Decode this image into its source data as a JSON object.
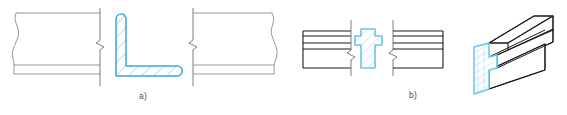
{
  "figure": {
    "captions": {
      "a": "a)",
      "b": "b)"
    },
    "colors": {
      "section_outline": "#3aa7dd",
      "section_hatch": "#6cc3e8",
      "section_fill": "#ffffff",
      "thin_outline": "#8a8a8a",
      "bold_outline": "#1a1a1a",
      "break_line": "#6e6e6e",
      "caption_text": "#4a4a4a",
      "page_background": "#ffffff"
    },
    "parts": [
      {
        "id": "a",
        "label": "a)",
        "description": "Long bar in elevation with a revolved angle (L) section placed in a break gap",
        "elements": [
          {
            "name": "left-bar-elevation",
            "kind": "orthographic-view",
            "edges": 3,
            "break_type": "wavy-break",
            "break_side": "left"
          },
          {
            "name": "left-break-line",
            "kind": "short-break-symbol",
            "orientation": "vertical",
            "zigzag": true
          },
          {
            "name": "angle-section",
            "kind": "revolved-section",
            "profile": "equal-leg-angle",
            "hatch": "45-degree-parallel-lines",
            "hatch_count": 7,
            "fillets": "rounded-toe-and-heel"
          },
          {
            "name": "right-break-line",
            "kind": "short-break-symbol",
            "orientation": "vertical",
            "zigzag": true
          },
          {
            "name": "right-bar-elevation",
            "kind": "orthographic-view",
            "edges": 3,
            "break_type": "wavy-break",
            "break_side": "right"
          }
        ]
      },
      {
        "id": "b",
        "label": "b)",
        "description": "Guide rail in elevation with a revolved cross-shaped section, plus pictorial view",
        "elements": [
          {
            "name": "left-rail-elevation",
            "kind": "orthographic-view",
            "horizontal_lines": 4,
            "break_type": "straight"
          },
          {
            "name": "left-break-line",
            "kind": "short-break-symbol",
            "orientation": "vertical",
            "zigzag": true
          },
          {
            "name": "rail-section",
            "kind": "revolved-section",
            "profile": "cross-shaped-guide-rail",
            "hatch": "45-degree-parallel-lines",
            "hatch_count": 4
          },
          {
            "name": "right-break-line",
            "kind": "short-break-symbol",
            "orientation": "vertical",
            "zigzag": true
          },
          {
            "name": "right-rail-elevation",
            "kind": "orthographic-view",
            "horizontal_lines": 4,
            "break_type": "straight"
          },
          {
            "name": "rail-pictorial-view",
            "kind": "isometric-3d-view",
            "cut_end": "hatched-section-face",
            "ridges": 3
          }
        ]
      }
    ]
  }
}
